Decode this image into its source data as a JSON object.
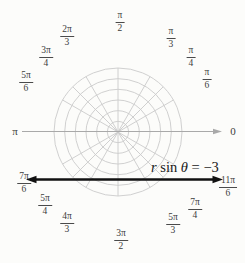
{
  "figure_title": "Polar graph of the line r sin θ = -3",
  "equation": {
    "r": "r",
    "sin_word": " sin ",
    "theta": "θ",
    "rhs": " = −3",
    "full_text": "r sin θ = −3"
  },
  "axis": {
    "label_0": "0",
    "label_pi": "π"
  },
  "labels": [
    {
      "name": "pi/2",
      "num": "π",
      "den": "2"
    },
    {
      "name": "pi/3",
      "num": "π",
      "den": "3"
    },
    {
      "name": "pi/4",
      "num": "π",
      "den": "4"
    },
    {
      "name": "pi/6",
      "num": "π",
      "den": "6"
    },
    {
      "name": "2pi/3",
      "num": "2π",
      "den": "3"
    },
    {
      "name": "3pi/4",
      "num": "3π",
      "den": "4"
    },
    {
      "name": "5pi/6",
      "num": "5π",
      "den": "6"
    },
    {
      "name": "7pi/6",
      "num": "7π",
      "den": "6"
    },
    {
      "name": "5pi/4",
      "num": "5π",
      "den": "4"
    },
    {
      "name": "4pi/3",
      "num": "4π",
      "den": "3"
    },
    {
      "name": "3pi/2",
      "num": "3π",
      "den": "2"
    },
    {
      "name": "5pi/3",
      "num": "5π",
      "den": "3"
    },
    {
      "name": "7pi/4",
      "num": "7π",
      "den": "4"
    },
    {
      "name": "11pi/6",
      "num": "11π",
      "den": "6"
    }
  ],
  "colors": {
    "grid": "#cbcbcb",
    "axis": "#a9a9a9",
    "graph_line": "#111111",
    "label_text": "#3c3c3c",
    "background": "#fcfcfa"
  },
  "chart_data": {
    "type": "line",
    "coordinate_system": "polar",
    "title": "",
    "equation": "r sin θ = −3",
    "cartesian_equivalent": "y = −3",
    "angle_tick_labels": [
      "0",
      "π/6",
      "π/4",
      "π/3",
      "π/2",
      "2π/3",
      "3π/4",
      "5π/6",
      "π",
      "7π/6",
      "5π/4",
      "4π/3",
      "3π/2",
      "5π/3",
      "7π/4",
      "11π/6"
    ],
    "spoke_angles_deg": [
      0,
      30,
      45,
      60,
      90,
      120,
      135,
      150,
      180,
      210,
      225,
      240,
      270,
      300,
      315,
      330
    ],
    "concentric_circles": 6,
    "grid_on": true,
    "legend": "none",
    "line_arrows": "both ends"
  }
}
